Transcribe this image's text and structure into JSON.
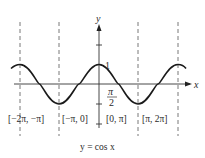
{
  "diagram": {
    "caption": "y = cos x",
    "x_axis_label": "x",
    "y_axis_label": "y",
    "y_tick_label": "1",
    "x_tick_label_num": "π",
    "x_tick_label_den": "2",
    "intervals": [
      "[−2π, −π]",
      "[−π, 0]",
      "[0, π]",
      "[π, 2π]"
    ],
    "colors": {
      "curve": "#1a1a1a",
      "axes": "#333333",
      "dashes": "#555555"
    }
  }
}
